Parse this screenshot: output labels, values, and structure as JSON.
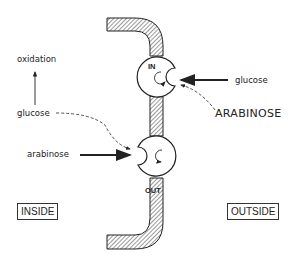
{
  "diagram": {
    "type": "membrane-carrier-transport",
    "labels": {
      "oxidation": "oxidation",
      "glucose_inside": "glucose",
      "arabinose_inside": "arabinose",
      "glucose_outside": "glucose",
      "arabinose_outside": "ARABINOSE",
      "carrier_in": "IN",
      "carrier_out": "OUT",
      "inside_box": "INSIDE",
      "outside_box": "OUTSIDE"
    },
    "nodes": [
      {
        "id": "carrier-in",
        "label": "IN",
        "position": "upper, facing outside"
      },
      {
        "id": "carrier-out",
        "label": "OUT",
        "position": "lower, facing inside"
      }
    ],
    "edges": [
      {
        "from": "glucose_outside",
        "to": "carrier-in",
        "style": "solid"
      },
      {
        "from": "arabinose_outside",
        "to": "carrier-in",
        "style": "dashed"
      },
      {
        "from": "arabinose_inside",
        "to": "carrier-out",
        "style": "solid"
      },
      {
        "from": "glucose_inside",
        "to": "carrier-out",
        "style": "dashed"
      },
      {
        "from": "glucose_inside",
        "to": "oxidation",
        "style": "solid"
      }
    ],
    "colors": {
      "ink": "#222222",
      "background": "#ffffff"
    }
  }
}
